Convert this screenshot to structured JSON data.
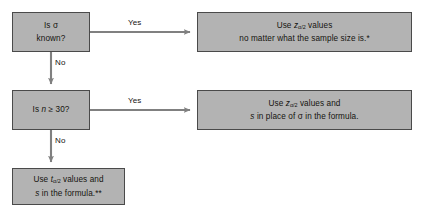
{
  "diagram": {
    "background_color": "#ffffff",
    "node_fill_color": "#b3b3b3",
    "node_border_color": "#4a4a4a",
    "connector_color": "#808080",
    "text_color": "#15130f"
  },
  "nodes": {
    "sigma_known": {
      "id": "is-sigma-known",
      "kind": "decision",
      "line1": "Is σ",
      "line2": "known?"
    },
    "n_ge_30": {
      "id": "is-n-ge-30",
      "kind": "decision",
      "line1": "Is n ≥ 30?"
    },
    "use_z_any_size": {
      "id": "use-z-any-sample-size",
      "kind": "outcome",
      "line1_prefix": "Use ",
      "line1_symbol": "z",
      "line1_subscript": "α/2",
      "line1_suffix": " values",
      "line2": "no matter what the sample size is.*"
    },
    "use_z_with_s": {
      "id": "use-z-with-s",
      "kind": "outcome",
      "line1_prefix": "Use ",
      "line1_symbol": "z",
      "line1_subscript": "α/2",
      "line1_suffix": " values and",
      "line2_var": "s",
      "line2_rest": " in place of σ in the formula."
    },
    "use_t_with_s": {
      "id": "use-t-with-s",
      "kind": "outcome",
      "line1_prefix": "Use ",
      "line1_symbol": "t",
      "line1_subscript": "α/2",
      "line1_suffix": " values and",
      "line2_var": "s",
      "line2_rest": " in the formula.**"
    }
  },
  "edges": {
    "sigma_yes": {
      "label": "Yes",
      "from": "is-sigma-known",
      "to": "use-z-any-sample-size"
    },
    "sigma_no": {
      "label": "No",
      "from": "is-sigma-known",
      "to": "is-n-ge-30"
    },
    "n_yes": {
      "label": "Yes",
      "from": "is-n-ge-30",
      "to": "use-z-with-s"
    },
    "n_no": {
      "label": "No",
      "from": "is-n-ge-30",
      "to": "use-t-with-s"
    }
  }
}
